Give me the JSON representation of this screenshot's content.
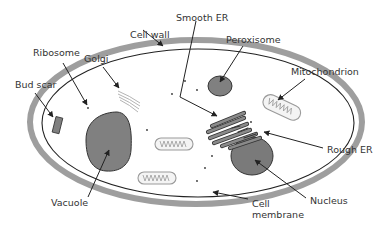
{
  "diagram": {
    "colors": {
      "cell_wall": "#9e9e9e",
      "membrane": "#222222",
      "organelle_fill": "#808080",
      "organelle_stroke": "#333333",
      "mitochondrion_stroke": "#9a9a9a",
      "label_text": "#333333",
      "arrow": "#222222"
    },
    "labels": {
      "smooth_er": "Smooth ER",
      "peroxisome": "Peroxisome",
      "cell_wall": "Cell wall",
      "ribosome": "Ribosome",
      "golgi": "Golgi",
      "mitochondrion": "Mitochondrion",
      "bud_scar": "Bud scar",
      "rough_er": "Rough ER",
      "vacuole": "Vacuole",
      "nucleus": "Nucleus",
      "cell_membrane_line1": "Cell",
      "cell_membrane_line2": "membrane"
    }
  }
}
